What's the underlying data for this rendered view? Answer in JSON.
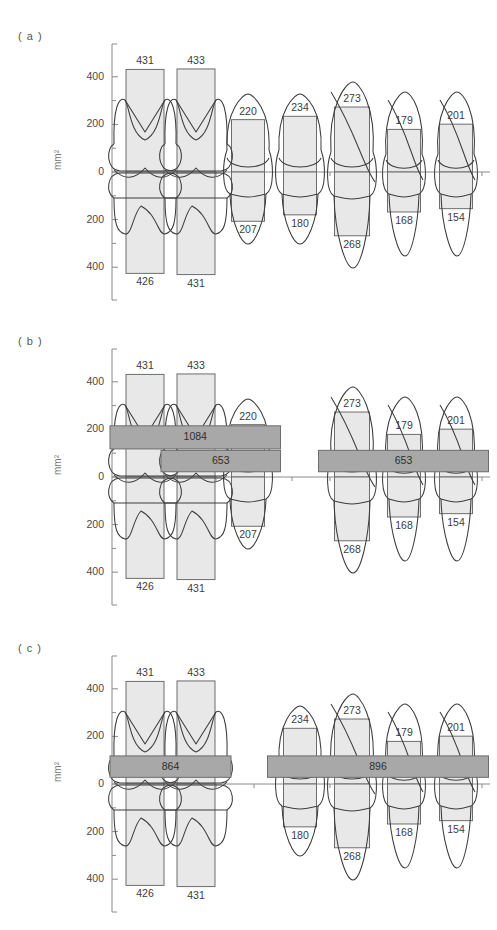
{
  "figure": {
    "title": "",
    "axis_unit": "mm²",
    "panels": [
      "( a )",
      "( b )",
      "( c )"
    ]
  },
  "chart_data": {
    "type": "bar",
    "title": "",
    "subtitle": "",
    "xlabel": "",
    "ylabel": "mm²",
    "ylim": [
      -500,
      500
    ],
    "yticks": [
      400,
      200,
      0,
      200,
      400
    ],
    "ytick_labels": [
      "400",
      "200",
      "0",
      "200",
      "400"
    ],
    "minor_ticks": [
      300,
      100,
      -100,
      -300
    ],
    "grid": false,
    "legend": null,
    "note": "Mirrored bar chart: crown (positive, above 0) and root (negative, below 0) cross-sectional areas per tooth, overlaid with tooth outline drawings. Three panels (a),(b),(c) show the same seven teeth with different shaded horizontal span-bars; some teeth are omitted in (b) and (c).",
    "categories": [
      "T1",
      "T2",
      "T3",
      "T4",
      "T5",
      "T6",
      "T7"
    ],
    "series": [
      {
        "name": "crown",
        "values": [
          431,
          433,
          220,
          234,
          273,
          179,
          201
        ]
      },
      {
        "name": "root",
        "values": [
          426,
          431,
          207,
          180,
          268,
          168,
          154
        ]
      }
    ],
    "panels": [
      {
        "id": "a",
        "label": "( a )",
        "teeth_shown": [
          "T1",
          "T2",
          "T3",
          "T4",
          "T5",
          "T6",
          "T7"
        ],
        "crown_labels": [
          "431",
          "433",
          "220",
          "234",
          "273",
          "179",
          "201"
        ],
        "root_labels": [
          "426",
          "431",
          "207",
          "180",
          "268",
          "168",
          "154"
        ],
        "bands": []
      },
      {
        "id": "b",
        "label": "( b )",
        "teeth_shown": [
          "T1",
          "T2",
          "T3",
          "T5",
          "T6",
          "T7"
        ],
        "crown_labels": [
          "431",
          "433",
          "220",
          "273",
          "179",
          "201"
        ],
        "root_labels": [
          "426",
          "431",
          "207",
          "268",
          "168",
          "154"
        ],
        "bands": [
          {
            "value": "1084",
            "y_top": 215,
            "y_bottom": 118,
            "from": "T1",
            "to": "T3"
          },
          {
            "value": "653",
            "y_top": 112,
            "y_bottom": 22,
            "from": "T2",
            "to": "T3"
          },
          {
            "value": "653",
            "y_top": 112,
            "y_bottom": 22,
            "from": "T5",
            "to": "T7"
          }
        ]
      },
      {
        "id": "c",
        "label": "( c )",
        "teeth_shown": [
          "T1",
          "T2",
          "T4",
          "T5",
          "T6",
          "T7"
        ],
        "crown_labels": [
          "431",
          "433",
          "234",
          "273",
          "179",
          "201"
        ],
        "root_labels": [
          "426",
          "431",
          "180",
          "268",
          "168",
          "154"
        ],
        "bands": [
          {
            "value": "864",
            "y_top": 118,
            "y_bottom": 28,
            "from": "T1",
            "to": "T2"
          },
          {
            "value": "896",
            "y_top": 118,
            "y_bottom": 28,
            "from": "T4",
            "to": "T7"
          }
        ]
      }
    ],
    "colors": {
      "bar_fill": "#e8e8e8",
      "bar_stroke": "#6d6d6d",
      "band_fill": "#a8a8a8",
      "band_stroke": "#6d6d6d",
      "tooth_stroke": "#3c3c3c",
      "axis": "#8a8a8a",
      "text": "#3c3c3c"
    }
  }
}
